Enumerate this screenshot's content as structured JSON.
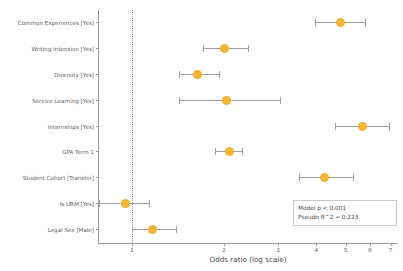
{
  "chart_data": {
    "type": "scatter",
    "subtype": "forest-plot",
    "title": "",
    "xlabel": "Odds ratio (log scale)",
    "ylabel": "",
    "xscale": "log",
    "xlim": [
      0.78,
      7.4
    ],
    "xticks": [
      "1",
      "2",
      "3",
      "4",
      "5",
      "6",
      "7"
    ],
    "xtick_values": [
      1,
      2,
      3,
      4,
      5,
      6,
      7
    ],
    "reference_line": 1,
    "grid": false,
    "legend": "none",
    "marker_color": "#f7b733",
    "errorbar_color": "#9e9e9e",
    "categories": [
      "Common Experiences [Yes]",
      "Writing Intensive [Yes]",
      "Diversity [Yes]",
      "Service Learning [Yes]",
      "Internships [Yes]",
      "GPA Term 1",
      "Student Cohort [Transfer]",
      "Is URM [Yes]",
      "Legal Sex [Male]"
    ],
    "points": [
      {
        "label": "Common Experiences [Yes]",
        "odds_ratio": 4.79,
        "ci_low": 3.95,
        "ci_high": 5.79
      },
      {
        "label": "Writing Intensive [Yes]",
        "odds_ratio": 2.0,
        "ci_low": 1.71,
        "ci_high": 2.39
      },
      {
        "label": "Diversity [Yes]",
        "odds_ratio": 1.64,
        "ci_low": 1.42,
        "ci_high": 1.92
      },
      {
        "label": "Service Learning [Yes]",
        "odds_ratio": 2.04,
        "ci_low": 1.42,
        "ci_high": 3.04
      },
      {
        "label": "Internships [Yes]",
        "odds_ratio": 5.68,
        "ci_low": 4.6,
        "ci_high": 6.91
      },
      {
        "label": "GPA Term 1",
        "odds_ratio": 2.08,
        "ci_low": 1.87,
        "ci_high": 2.28
      },
      {
        "label": "Student Cohort [Transfer]",
        "odds_ratio": 4.27,
        "ci_low": 3.52,
        "ci_high": 5.26
      },
      {
        "label": "Is URM [Yes]",
        "odds_ratio": 0.95,
        "ci_low": 0.78,
        "ci_high": 1.14
      },
      {
        "label": "Legal Sex [Male]",
        "odds_ratio": 1.17,
        "ci_low": 1.0,
        "ci_high": 1.39
      }
    ],
    "annotations": {
      "line1": "Model p < 0.001",
      "line2": "Pseudo R^2 = 0.223"
    }
  }
}
